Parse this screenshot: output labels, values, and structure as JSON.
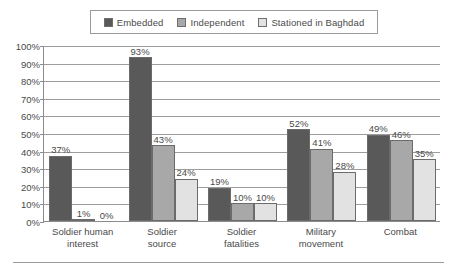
{
  "legend": {
    "position": "top-center",
    "entries": [
      {
        "label": "Embedded",
        "color": "#595959",
        "icon": "legend-swatch-icon"
      },
      {
        "label": "Independent",
        "color": "#a8a8a8",
        "icon": "legend-swatch-icon"
      },
      {
        "label": "Stationed in Baghdad",
        "color": "#e2e2e2",
        "icon": "legend-swatch-icon"
      }
    ]
  },
  "chart_data": {
    "type": "bar",
    "title": "",
    "xlabel": "",
    "ylabel": "",
    "ylim": [
      0,
      100
    ],
    "ytick_labels": [
      "100%",
      "90%",
      "80%",
      "70%",
      "60%",
      "50%",
      "40%",
      "30%",
      "20%",
      "10%",
      "0%"
    ],
    "ytick_values": [
      100,
      90,
      80,
      70,
      60,
      50,
      40,
      30,
      20,
      10,
      0
    ],
    "grid": true,
    "grid_axis": "y",
    "categories": [
      "Soldier human interest",
      "Soldier source",
      "Soldier fatalities",
      "Military movement",
      "Combat"
    ],
    "category_lines": [
      [
        "Soldier human",
        "interest"
      ],
      [
        "Soldier",
        "source"
      ],
      [
        "Soldier",
        "fatalities"
      ],
      [
        "Military",
        "movement"
      ],
      [
        "Combat",
        ""
      ]
    ],
    "series": [
      {
        "name": "Embedded",
        "color": "#595959",
        "values": [
          37,
          93,
          19,
          52,
          49
        ],
        "labels": [
          "37%",
          "93%",
          "19%",
          "52%",
          "49%"
        ]
      },
      {
        "name": "Independent",
        "color": "#a8a8a8",
        "values": [
          1,
          43,
          10,
          41,
          46
        ],
        "labels": [
          "1%",
          "43%",
          "10%",
          "41%",
          "46%"
        ]
      },
      {
        "name": "Stationed in Baghdad",
        "color": "#e2e2e2",
        "values": [
          0,
          24,
          10,
          28,
          35
        ],
        "labels": [
          "0%",
          "24%",
          "10%",
          "28%",
          "35%"
        ]
      }
    ]
  }
}
